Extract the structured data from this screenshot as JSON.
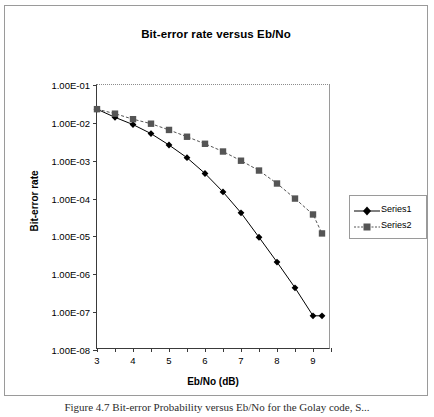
{
  "figure": {
    "caption": "Figure 4.7 Bit-error Probability versus Eb/No for the Golay code, S..."
  },
  "chart_data": {
    "type": "line",
    "title": "Bit-error rate versus Eb/No",
    "xlabel": "Eb/No (dB)",
    "ylabel": "Bit-error rate",
    "xlim": [
      3,
      9.5
    ],
    "ylim": [
      1e-08,
      0.1
    ],
    "yscale": "log",
    "grid": false,
    "legend_position": "right",
    "xticks": [
      3,
      4,
      5,
      6,
      7,
      8,
      9
    ],
    "xtick_labels": [
      "3",
      "4",
      "5",
      "6",
      "7",
      "8",
      "9"
    ],
    "xminor_step": 0.5,
    "yticks": [
      0.1,
      0.01,
      0.001,
      0.0001,
      1e-05,
      1e-06,
      1e-07,
      1e-08
    ],
    "ytick_labels": [
      "1.00E-01",
      "1.00E-02",
      "1.00E-03",
      "1.00E-04",
      "1.00E-05",
      "1.00E-06",
      "1.00E-07",
      "1.00E-08"
    ],
    "series": [
      {
        "name": "Series1",
        "marker": "diamond",
        "color": "#000000",
        "linestyle": "solid",
        "x": [
          3.0,
          3.5,
          4.0,
          4.5,
          5.0,
          5.5,
          6.0,
          6.5,
          7.0,
          7.5,
          8.0,
          8.5,
          9.0,
          9.25
        ],
        "y": [
          0.023,
          0.014,
          0.009,
          0.0052,
          0.0026,
          0.0012,
          0.00046,
          0.00015,
          4.2e-05,
          9.5e-06,
          2.1e-06,
          4.4e-07,
          8e-08,
          8e-08
        ]
      },
      {
        "name": "Series2",
        "marker": "square",
        "color": "#555555",
        "linestyle": "dashed",
        "x": [
          3.0,
          3.5,
          4.0,
          4.5,
          5.0,
          5.5,
          6.0,
          6.5,
          7.0,
          7.5,
          8.0,
          8.5,
          9.0,
          9.25
        ],
        "y": [
          0.023,
          0.0175,
          0.0125,
          0.0095,
          0.0065,
          0.0043,
          0.0028,
          0.00175,
          0.001,
          0.00055,
          0.00025,
          0.0001,
          3.8e-05,
          1.2e-05
        ]
      }
    ]
  },
  "legend": {
    "items": [
      {
        "label": "Series1"
      },
      {
        "label": "Series2"
      }
    ]
  }
}
